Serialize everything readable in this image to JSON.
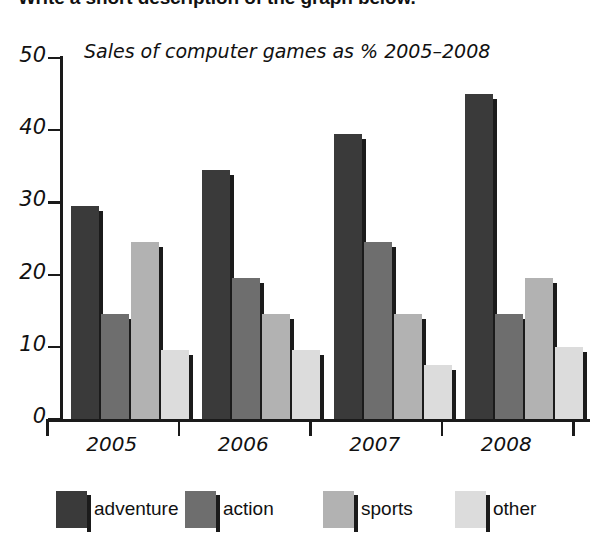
{
  "instruction": "Write a short description of the graph below.",
  "chart_data": {
    "type": "bar",
    "title": "Sales of computer games as % 2005–2008",
    "xlabel": "",
    "ylabel": "",
    "ylim": [
      0,
      50
    ],
    "y_ticks": [
      0,
      10,
      20,
      30,
      40,
      50
    ],
    "grid": false,
    "legend_position": "bottom",
    "categories": [
      "2005",
      "2006",
      "2007",
      "2008"
    ],
    "series": [
      {
        "name": "adventure",
        "color": "#3a3a3a",
        "values": [
          29.5,
          34.5,
          39.5,
          45
        ]
      },
      {
        "name": "action",
        "color": "#6e6e6e",
        "values": [
          14.5,
          19.5,
          24.5,
          14.5
        ]
      },
      {
        "name": "sports",
        "color": "#b2b2b2",
        "values": [
          24.5,
          14.5,
          14.5,
          19.5
        ]
      },
      {
        "name": "other",
        "color": "#dcdcdc",
        "values": [
          9.5,
          9.5,
          7.5,
          10
        ]
      }
    ]
  }
}
